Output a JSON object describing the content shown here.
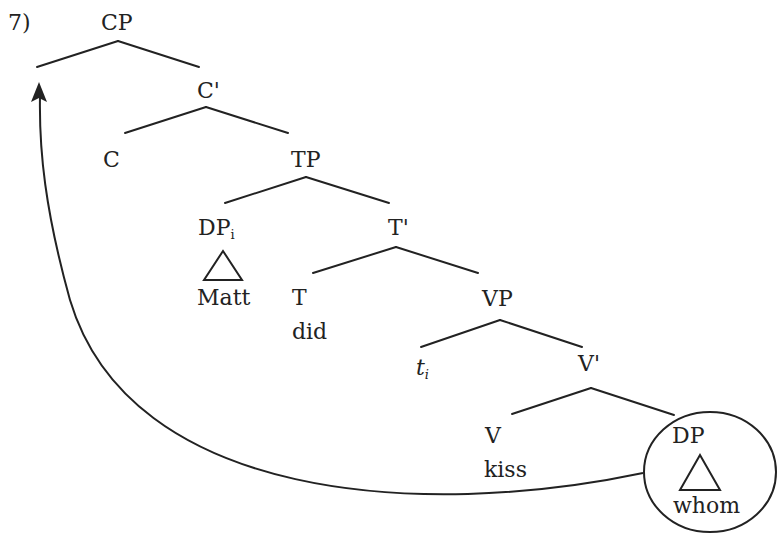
{
  "example_number": "7)",
  "colors": {
    "ink": "#222222",
    "background": "#ffffff"
  },
  "nodes": {
    "cp": "CP",
    "c_bar": "C'",
    "c": "C",
    "tp": "TP",
    "dp_subject": "DP",
    "dp_subject_index": "i",
    "matt": "Matt",
    "t_bar": "T'",
    "t": "T",
    "did": "did",
    "vp": "VP",
    "trace": "t",
    "trace_index": "i",
    "v_bar": "V'",
    "v": "V",
    "kiss": "kiss",
    "dp_object": "DP",
    "whom": "whom"
  },
  "movement": {
    "from": "DP (whom)",
    "to": "Spec-CP",
    "arrow": "curved-arrow"
  }
}
